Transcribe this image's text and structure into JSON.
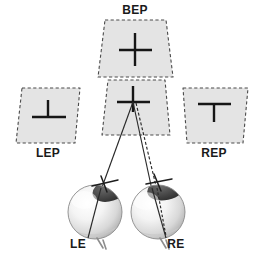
{
  "figure": {
    "background_color": "#ffffff",
    "width": 262,
    "height": 263
  },
  "colors": {
    "plane_fill": "#e4e4e4",
    "plane_border": "#4a4a4a",
    "target_stroke": "#161616",
    "ray_stroke": "#2a2a2a",
    "label_text": "#1a1a1a",
    "cornea_dark": "#4b4b4b",
    "sclera_light": "#f2f2f2"
  },
  "planes": [
    {
      "id": "bep",
      "label": "BEP",
      "label_position": "top",
      "target_symbol": "plus",
      "target_description": "full cross — vertical line crossing horizontal line",
      "x": 97,
      "y": 20,
      "width": 76,
      "height": 57
    },
    {
      "id": "cyclopean",
      "label": "",
      "label_position": "none",
      "target_symbol": "plus-with-rays",
      "target_description": "cross at convergence point of both visual axes",
      "x": 102,
      "y": 80,
      "width": 68,
      "height": 55
    },
    {
      "id": "lep",
      "label": "LEP",
      "label_position": "bottom",
      "target_symbol": "up-tack",
      "target_description": "inverted T — vertical line standing on horizontal line",
      "x": 16,
      "y": 88,
      "width": 64,
      "height": 55
    },
    {
      "id": "rep",
      "label": "REP",
      "label_position": "bottom",
      "target_symbol": "tee",
      "target_description": "T — horizontal line on top with vertical line hanging below",
      "x": 180,
      "y": 88,
      "width": 68,
      "height": 55
    }
  ],
  "eyes": [
    {
      "id": "le",
      "label": "LE",
      "label_x": 78,
      "label_y": 248,
      "center_x": 95,
      "center_y": 212,
      "radius": 27,
      "axis_type": "solid",
      "description": "left eye with solid visual axis"
    },
    {
      "id": "re",
      "label": "RE",
      "label_x": 176,
      "label_y": 248,
      "center_x": 158,
      "center_y": 212,
      "radius": 27,
      "axis_type": "solid-and-dashed",
      "description": "right eye with solid visual axis and dashed deviated axis"
    }
  ],
  "rays": [
    {
      "id": "le-ray",
      "style": "solid",
      "from": "left-eye-cornea",
      "to": "convergence-point"
    },
    {
      "id": "re-ray",
      "style": "solid",
      "from": "right-eye-cornea",
      "to": "convergence-point"
    },
    {
      "id": "re-ray-deviated",
      "style": "dashed",
      "from": "right-eye-cornea",
      "to": "convergence-point"
    }
  ],
  "convergence_point": {
    "x": 133,
    "y": 102
  }
}
